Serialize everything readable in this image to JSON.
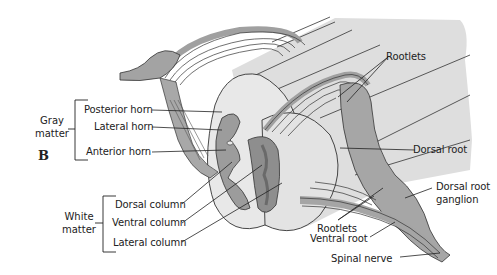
{
  "figure": {
    "panel_label": "B",
    "colors": {
      "background": "#ffffff",
      "cord_light": "#d9d9d9",
      "cord_face": "#e6e6e6",
      "gray_matter": "#9a9a9a",
      "gray_matter_dark": "#7d7d7d",
      "roots": "#a3a3a3",
      "outline": "#333333"
    }
  },
  "groups": {
    "gray_matter": {
      "line1": "Gray",
      "line2": "matter"
    },
    "white_matter": {
      "line1": "White",
      "line2": "matter"
    }
  },
  "labels": {
    "posterior_horn": "Posterior horn",
    "lateral_horn": "Lateral horn",
    "anterior_horn": "Anterior horn",
    "dorsal_column": "Dorsal column",
    "ventral_column": "Ventral column",
    "lateral_column": "Lateral column",
    "rootlets_top": "Rootlets",
    "rootlets_bottom": "Rootlets",
    "dorsal_root": "Dorsal root",
    "dorsal_root_ganglion_1": "Dorsal root",
    "dorsal_root_ganglion_2": "ganglion",
    "ventral_root": "Ventral root",
    "spinal_nerve": "Spinal nerve"
  }
}
